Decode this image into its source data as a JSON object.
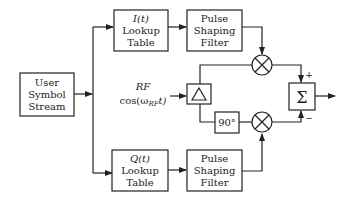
{
  "diagram": {
    "type": "block-diagram",
    "blocks": {
      "source": {
        "lines": [
          "User",
          "Symbol",
          "Stream"
        ]
      },
      "i_lut": {
        "title": "I(t)",
        "lines": [
          "Lookup",
          "Table"
        ]
      },
      "q_lut": {
        "title": "Q(t)",
        "lines": [
          "Lookup",
          "Table"
        ]
      },
      "i_filter": {
        "lines": [
          "Pulse",
          "Shaping",
          "Filter"
        ]
      },
      "q_filter": {
        "lines": [
          "Pulse",
          "Shaping",
          "Filter"
        ]
      },
      "splitter": {
        "symbol": "Δ"
      },
      "phase_shift": {
        "label": "90°"
      },
      "i_mixer": {
        "symbol": "⊗"
      },
      "q_mixer": {
        "symbol": "⊗"
      },
      "summer": {
        "symbol": "Σ",
        "plus_sign": "+",
        "minus_sign": "−"
      }
    },
    "rf_input": {
      "label": "RF",
      "expr_prefix": "cos(ω",
      "expr_sub": "RF",
      "expr_suffix": "t)"
    },
    "connections": [
      [
        "source",
        "i_lut"
      ],
      [
        "source",
        "q_lut"
      ],
      [
        "i_lut",
        "i_filter"
      ],
      [
        "q_lut",
        "q_filter"
      ],
      [
        "i_filter",
        "i_mixer"
      ],
      [
        "q_filter",
        "q_mixer"
      ],
      [
        "rf_input",
        "splitter"
      ],
      [
        "splitter",
        "i_mixer"
      ],
      [
        "splitter",
        "phase_shift"
      ],
      [
        "phase_shift",
        "q_mixer"
      ],
      [
        "i_mixer",
        "summer"
      ],
      [
        "q_mixer",
        "summer"
      ],
      [
        "summer",
        "output"
      ]
    ]
  }
}
